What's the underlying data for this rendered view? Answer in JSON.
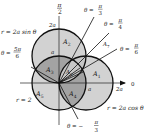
{
  "figure": {
    "type": "polar-region-diagram",
    "origin": [
      59,
      83
    ],
    "unit_a_px": 27,
    "colors": {
      "light_fill": "#d2d2d2",
      "dark_fill": "#9e9e9e",
      "mid_fill": "#bdbdbd",
      "lens_fill": "#c8c8c8",
      "stroke": "#111111",
      "background": "#ffffff"
    },
    "axes": {
      "top_label_num": "π",
      "top_label_den": "2",
      "right_label": "0",
      "tick_2a_vertical": "2a",
      "tick_a_vertical": "a",
      "tick_a_horizontal": "a",
      "tick_2a_horizontal": "2a"
    },
    "curves": [
      {
        "name": "r = 2a sin θ",
        "label": "r = 2a sin θ"
      },
      {
        "name": "r = 2a cos θ",
        "label": "r = 2a cos θ"
      },
      {
        "name": "r = 2",
        "label": "r = 2"
      }
    ],
    "rays": [
      {
        "angle": "π/3",
        "label_prefix": "θ =",
        "num": "π",
        "den": "3"
      },
      {
        "angle": "π/4",
        "label_prefix": "θ =",
        "num": "π",
        "den": "4"
      },
      {
        "angle": "π/6",
        "label_prefix": "θ =",
        "num": "π",
        "den": "6"
      },
      {
        "angle": "5π/6",
        "label_prefix": "θ =",
        "num": "5π",
        "den": "6"
      },
      {
        "angle": "-π/3",
        "label_prefix": "θ = −",
        "num": "π",
        "den": "3"
      }
    ],
    "regions": [
      {
        "label": "A",
        "sub": "1"
      },
      {
        "label": "A",
        "sub": "2"
      },
      {
        "label": "A",
        "sub": "3"
      },
      {
        "label": "A",
        "sub": "4"
      },
      {
        "label": "A",
        "sub": "5"
      },
      {
        "label": "A",
        "sub": "6"
      },
      {
        "label": "A",
        "sub": "7"
      }
    ]
  }
}
